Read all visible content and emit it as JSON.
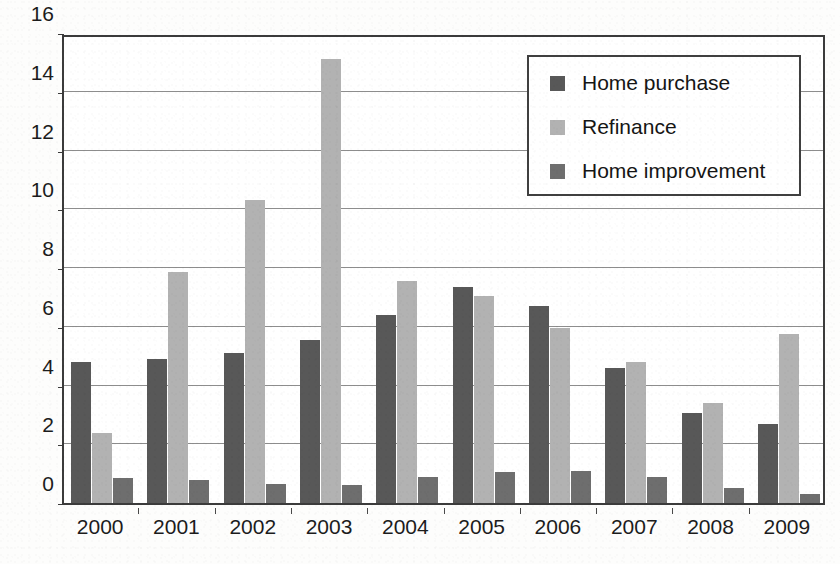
{
  "chart_data": {
    "type": "bar",
    "title": "",
    "subtitle": "",
    "xlabel": "",
    "ylabel": "",
    "categories": [
      "2000",
      "2001",
      "2002",
      "2003",
      "2004",
      "2005",
      "2006",
      "2007",
      "2008",
      "2009"
    ],
    "series": [
      {
        "name": "Home purchase",
        "color": "#585858",
        "values": [
          4.8,
          4.9,
          5.1,
          5.55,
          6.4,
          7.35,
          6.7,
          4.6,
          3.05,
          2.7
        ]
      },
      {
        "name": "Refinance",
        "color": "#b2b2b2",
        "values": [
          2.4,
          7.85,
          10.3,
          15.1,
          7.55,
          7.05,
          5.95,
          4.8,
          3.4,
          5.75
        ]
      },
      {
        "name": "Home improvement",
        "color": "#6e6e6e",
        "values": [
          0.85,
          0.8,
          0.65,
          0.6,
          0.9,
          1.05,
          1.1,
          0.9,
          0.5,
          0.3
        ]
      }
    ],
    "ylim": [
      0,
      16
    ],
    "ytick_step": 2,
    "yticks": [
      "0",
      "2",
      "4",
      "6",
      "8",
      "10",
      "12",
      "14",
      "16"
    ],
    "grid": true,
    "legend_position": "top-right"
  },
  "legend": {
    "items": [
      {
        "label": "Home purchase",
        "swatch": "legend-swatch-home-purchase"
      },
      {
        "label": "Refinance",
        "swatch": "legend-swatch-refinance"
      },
      {
        "label": "Home improvement",
        "swatch": "legend-swatch-home-improvement"
      }
    ]
  },
  "footer": {
    "bleed_text": ""
  }
}
